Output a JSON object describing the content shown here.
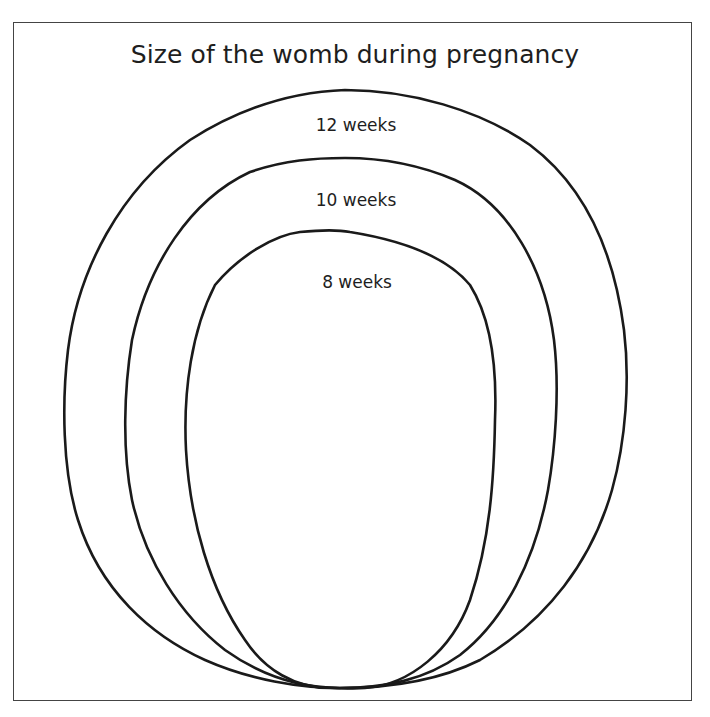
{
  "title": "Size of the womb during pregnancy",
  "stages": [
    {
      "id": "12-weeks",
      "label": "12 weeks",
      "weeks": 12
    },
    {
      "id": "10-weeks",
      "label": "10 weeks",
      "weeks": 10
    },
    {
      "id": "8-weeks",
      "label": "8 weeks",
      "weeks": 8
    }
  ],
  "colors": {
    "outline": "#1a1a1a",
    "text": "#1e1e1e",
    "background": "#ffffff",
    "frame": "#444444"
  }
}
